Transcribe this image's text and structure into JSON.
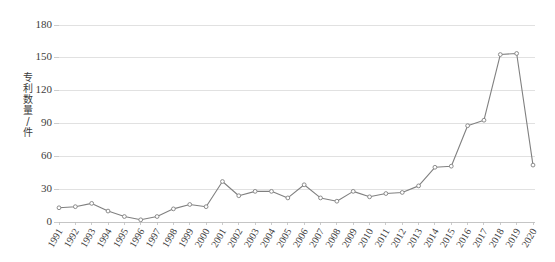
{
  "chart_data": {
    "type": "line",
    "title": "",
    "subtitle": "",
    "xlabel": "",
    "ylabel": "专利数量/件",
    "ylim": [
      0,
      180
    ],
    "yticks": [
      0,
      30,
      60,
      90,
      120,
      150,
      180
    ],
    "ytick_labels": [
      "0",
      "30",
      "60",
      "90",
      "120",
      "150",
      "180"
    ],
    "grid": true,
    "legend": "none",
    "categories": [
      "1991",
      "1992",
      "1993",
      "1994",
      "1995",
      "1996",
      "1997",
      "1998",
      "1999",
      "2000",
      "2001",
      "2002",
      "2003",
      "2004",
      "2005",
      "2006",
      "2007",
      "2008",
      "2009",
      "2010",
      "2011",
      "2012",
      "2013",
      "2014",
      "2015",
      "2016",
      "2017",
      "2018",
      "2019",
      "2020"
    ],
    "values": [
      13,
      14,
      17,
      10,
      5,
      2,
      5,
      12,
      16,
      14,
      37,
      24,
      28,
      28,
      22,
      34,
      22,
      19,
      28,
      23,
      26,
      27,
      33,
      50,
      51,
      88,
      93,
      153,
      154,
      52
    ],
    "series": [
      {
        "name": "专利数量",
        "color": "#808080",
        "marker": "circle",
        "values": [
          13,
          14,
          17,
          10,
          5,
          2,
          5,
          12,
          16,
          14,
          37,
          24,
          28,
          28,
          22,
          34,
          22,
          19,
          28,
          23,
          26,
          27,
          33,
          50,
          51,
          88,
          93,
          153,
          154,
          52
        ]
      }
    ],
    "annotations": []
  },
  "colors": {
    "background": "#ffffff",
    "gridline": "#d9d9d9",
    "axis": "#bfbfbf",
    "series": "#808080",
    "text": "#404040"
  }
}
